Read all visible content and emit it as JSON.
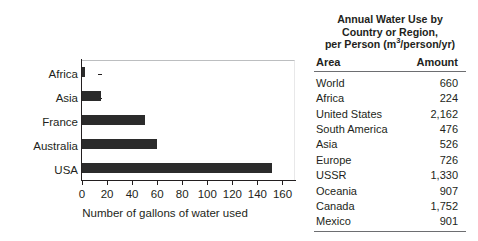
{
  "chart_data": {
    "type": "bar",
    "orientation": "horizontal",
    "title": "",
    "xlabel": "Number of gallons of water used",
    "ylabel": "Location",
    "categories": [
      "Africa",
      "Asia",
      "France",
      "Australia",
      "USA"
    ],
    "values": [
      2,
      15,
      50,
      60,
      152
    ],
    "xlim": [
      0,
      170
    ],
    "xticks": [
      0,
      20,
      40,
      60,
      80,
      100,
      120,
      140,
      160
    ],
    "xticklabels": [
      "0",
      "20",
      "40",
      "60",
      "80",
      "100",
      "120",
      "140",
      "160"
    ],
    "grid": false,
    "legend": null,
    "bar_color": "#2b2b2b"
  },
  "table": {
    "title_lines": [
      "Annual Water Use by",
      "Country or Region,",
      "per Person (m3/person/yr)"
    ],
    "title_line3_prefix": "per Person (m",
    "title_line3_sup": "3",
    "title_line3_suffix": "/person/yr)",
    "columns": [
      "Area",
      "Amount"
    ],
    "rows": [
      {
        "area": "World",
        "amount": "660"
      },
      {
        "area": "Africa",
        "amount": "224"
      },
      {
        "area": "United States",
        "amount": "2,162"
      },
      {
        "area": "South America",
        "amount": "476"
      },
      {
        "area": "Asia",
        "amount": "526"
      },
      {
        "area": "Europe",
        "amount": "726"
      },
      {
        "area": "USSR",
        "amount": "1,330"
      },
      {
        "area": "Oceania",
        "amount": "907"
      },
      {
        "area": "Canada",
        "amount": "1,752"
      },
      {
        "area": "Mexico",
        "amount": "901"
      }
    ]
  },
  "colors": {
    "ink": "#231f20",
    "rule": "#6d6e71",
    "bar": "#2b2b2b",
    "plot_border": "#bcbec0"
  }
}
